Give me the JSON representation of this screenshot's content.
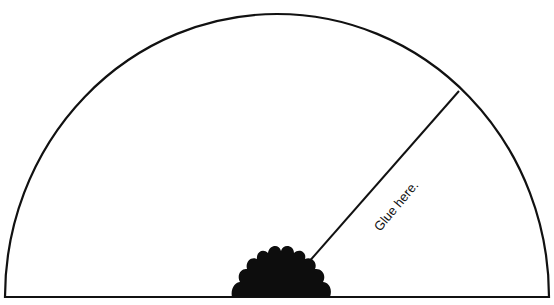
{
  "diagram": {
    "type": "semicircle-template",
    "stroke_color": "#111111",
    "fill_color": "#ffffff",
    "flower_color": "#0d0d0d",
    "glue_label": "Glue here."
  }
}
